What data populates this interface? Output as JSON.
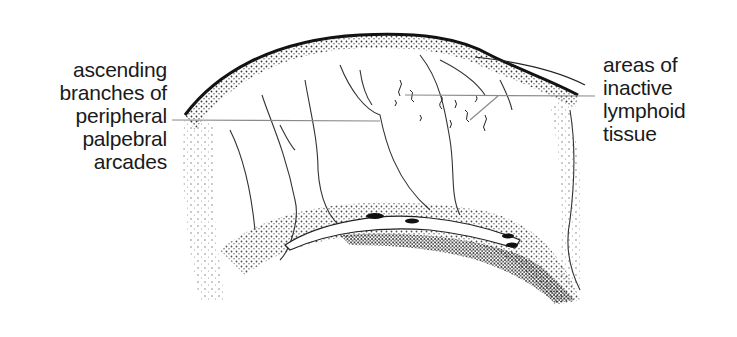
{
  "diagram": {
    "labels": {
      "left": {
        "lines": [
          "ascending",
          "branches of",
          "peripheral",
          "palpebral",
          "arcades"
        ]
      },
      "right": {
        "lines": [
          "areas of",
          "inactive",
          "lymphoid",
          "tissue"
        ]
      }
    },
    "colors": {
      "ink": "#1a1a1a",
      "leader_line": "#8a8a8a",
      "background": "#ffffff"
    }
  }
}
